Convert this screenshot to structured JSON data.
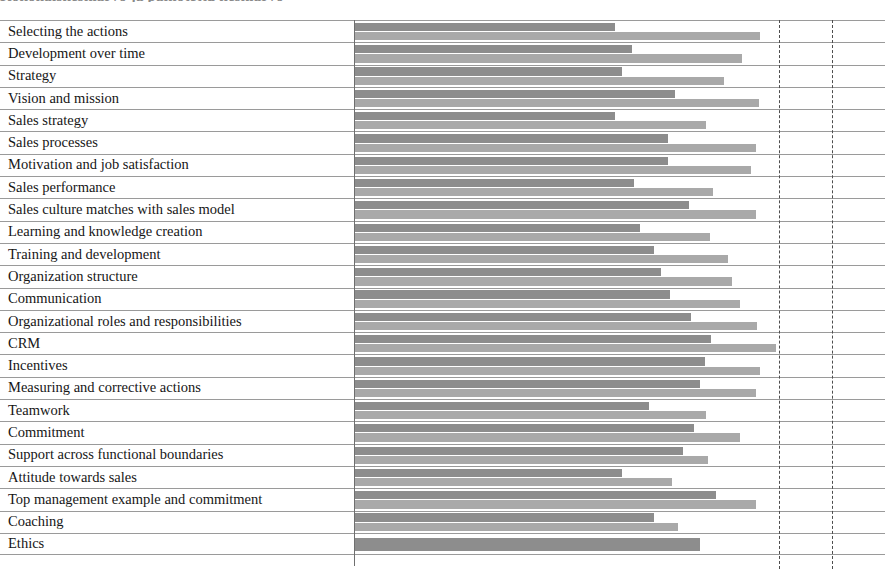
{
  "title_sliver": "Kokonaiskeskiarvo ja painotettu keskiarvo",
  "chart_data": {
    "type": "bar",
    "orientation": "horizontal",
    "title": "",
    "xlabel": "",
    "ylabel": "",
    "grid": true,
    "gridlines_x": [
      4.0,
      4.5
    ],
    "xlim": [
      0,
      5
    ],
    "legend_position": "none",
    "categories": [
      "Selecting the actions",
      "Development over time",
      "Strategy",
      "Vision and mission",
      "Sales strategy",
      "Sales processes",
      "Motivation and job satisfaction",
      "Sales performance",
      "Sales culture matches with sales model",
      "Learning and knowledge creation",
      "Training and development",
      "Organization structure",
      "Communication",
      "Organizational roles and responsibilities",
      "CRM",
      "Incentives",
      "Measuring and corrective actions",
      "Teamwork",
      "Commitment",
      "Support across functional boundaries",
      "Attitude towards sales",
      "Top management example and commitment",
      "Coaching",
      "Ethics"
    ],
    "series": [
      {
        "name": "Series 1",
        "color": "#8d8d8d",
        "values": [
          2.45,
          2.61,
          2.52,
          3.02,
          2.45,
          2.95,
          2.95,
          2.63,
          3.15,
          2.69,
          2.82,
          2.89,
          2.97,
          3.17,
          3.36,
          3.3,
          3.25,
          2.77,
          3.2,
          3.09,
          2.52,
          3.41,
          2.82,
          3.25
        ]
      },
      {
        "name": "Series 2",
        "color": "#a9a9a9",
        "values": [
          3.82,
          3.65,
          3.48,
          3.81,
          3.31,
          3.78,
          3.74,
          3.38,
          3.78,
          3.35,
          3.52,
          3.56,
          3.63,
          3.79,
          3.97,
          3.82,
          3.78,
          3.31,
          3.63,
          3.33,
          2.99,
          3.78,
          3.05,
          null
        ]
      }
    ]
  }
}
